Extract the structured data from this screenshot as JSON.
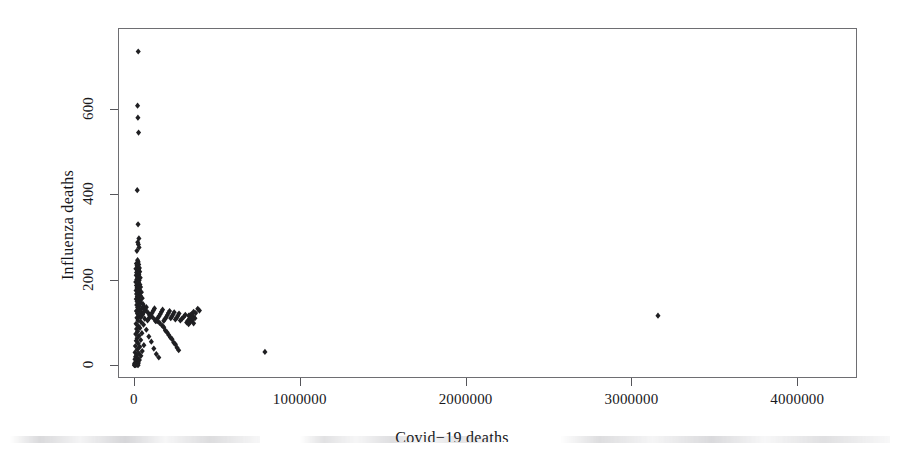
{
  "figure": {
    "type": "scatter-plot",
    "background_color": "#ffffff",
    "frame_color": "#6e6e72",
    "point_color": "#1f1f22"
  },
  "axes": {
    "x": {
      "label": "Covid−19 deaths",
      "ticks": [
        {
          "value": 0,
          "label": "0"
        },
        {
          "value": 1000000,
          "label": "1000000"
        },
        {
          "value": 2000000,
          "label": "2000000"
        },
        {
          "value": 3000000,
          "label": "3000000"
        },
        {
          "value": 4000000,
          "label": "4000000"
        }
      ],
      "range": [
        -96000,
        4360000
      ]
    },
    "y": {
      "label": "Influenza deaths",
      "ticks": [
        {
          "value": 0,
          "label": "0"
        },
        {
          "value": 200,
          "label": "200"
        },
        {
          "value": 400,
          "label": "400"
        },
        {
          "value": 600,
          "label": "600"
        }
      ],
      "range": [
        -30,
        790
      ]
    }
  },
  "artifact": {
    "name": "scan-smudge-band",
    "description": "faint grey band of clipped text from the page below"
  },
  "chart_data": {
    "type": "scatter",
    "title": "",
    "xlabel": "Covid−19 deaths",
    "ylabel": "Influenza deaths",
    "xlim": [
      -96000,
      4360000
    ],
    "ylim": [
      -30,
      790
    ],
    "xticks": [
      0,
      1000000,
      2000000,
      3000000,
      4000000
    ],
    "yticks": [
      0,
      200,
      400,
      600
    ],
    "grid": false,
    "legend": null,
    "marker": "filled-diamond",
    "marker_color": "#1f1f22",
    "points": [
      [
        26000,
        735
      ],
      [
        22000,
        608
      ],
      [
        24000,
        580
      ],
      [
        28000,
        545
      ],
      [
        20000,
        410
      ],
      [
        25000,
        330
      ],
      [
        30000,
        297
      ],
      [
        23000,
        288
      ],
      [
        27000,
        283
      ],
      [
        31000,
        276
      ],
      [
        18000,
        268
      ],
      [
        22000,
        246
      ],
      [
        26000,
        242
      ],
      [
        15000,
        238
      ],
      [
        29000,
        236
      ],
      [
        19000,
        233
      ],
      [
        24000,
        230
      ],
      [
        33000,
        228
      ],
      [
        12000,
        226
      ],
      [
        28000,
        224
      ],
      [
        21000,
        221
      ],
      [
        35000,
        219
      ],
      [
        16000,
        217
      ],
      [
        25000,
        215
      ],
      [
        30000,
        213
      ],
      [
        14000,
        211
      ],
      [
        27000,
        209
      ],
      [
        20000,
        207
      ],
      [
        38000,
        205
      ],
      [
        23000,
        203
      ],
      [
        17000,
        201
      ],
      [
        32000,
        199
      ],
      [
        26000,
        197
      ],
      [
        11000,
        195
      ],
      [
        29000,
        193
      ],
      [
        21000,
        191
      ],
      [
        36000,
        189
      ],
      [
        15000,
        187
      ],
      [
        24000,
        185
      ],
      [
        40000,
        183
      ],
      [
        18000,
        181
      ],
      [
        28000,
        179
      ],
      [
        33000,
        177
      ],
      [
        13000,
        175
      ],
      [
        22000,
        173
      ],
      [
        45000,
        171
      ],
      [
        26000,
        169
      ],
      [
        16000,
        167
      ],
      [
        31000,
        165
      ],
      [
        38000,
        163
      ],
      [
        20000,
        161
      ],
      [
        24000,
        159
      ],
      [
        50000,
        157
      ],
      [
        14000,
        155
      ],
      [
        29000,
        153
      ],
      [
        35000,
        151
      ],
      [
        19000,
        149
      ],
      [
        42000,
        147
      ],
      [
        25000,
        145
      ],
      [
        55000,
        143
      ],
      [
        17000,
        141
      ],
      [
        32000,
        139
      ],
      [
        60000,
        137
      ],
      [
        22000,
        135
      ],
      [
        47000,
        133
      ],
      [
        27000,
        131
      ],
      [
        70000,
        129
      ],
      [
        15000,
        127
      ],
      [
        38000,
        125
      ],
      [
        85000,
        123
      ],
      [
        21000,
        121
      ],
      [
        52000,
        119
      ],
      [
        95000,
        117
      ],
      [
        3160000,
        116
      ],
      [
        30000,
        115
      ],
      [
        110000,
        113
      ],
      [
        18000,
        111
      ],
      [
        65000,
        109
      ],
      [
        125000,
        107
      ],
      [
        25000,
        105
      ],
      [
        140000,
        103
      ],
      [
        43000,
        101
      ],
      [
        155000,
        99
      ],
      [
        13000,
        97
      ],
      [
        58000,
        95
      ],
      [
        170000,
        93
      ],
      [
        28000,
        91
      ],
      [
        180000,
        89
      ],
      [
        36000,
        87
      ],
      [
        16000,
        85
      ],
      [
        75000,
        83
      ],
      [
        190000,
        81
      ],
      [
        22000,
        79
      ],
      [
        200000,
        77
      ],
      [
        48000,
        75
      ],
      [
        11000,
        73
      ],
      [
        210000,
        71
      ],
      [
        31000,
        69
      ],
      [
        90000,
        67
      ],
      [
        220000,
        65
      ],
      [
        19000,
        63
      ],
      [
        230000,
        61
      ],
      [
        41000,
        59
      ],
      [
        14000,
        57
      ],
      [
        105000,
        55
      ],
      [
        240000,
        53
      ],
      [
        26000,
        51
      ],
      [
        250000,
        49
      ],
      [
        60000,
        47
      ],
      [
        9000,
        45
      ],
      [
        35000,
        43
      ],
      [
        260000,
        41
      ],
      [
        120000,
        39
      ],
      [
        21000,
        37
      ],
      [
        270000,
        35
      ],
      [
        790000,
        31
      ],
      [
        50000,
        33
      ],
      [
        7000,
        30
      ],
      [
        30000,
        28
      ],
      [
        135000,
        26
      ],
      [
        17000,
        24
      ],
      [
        42000,
        22
      ],
      [
        10000,
        20
      ],
      [
        150000,
        18
      ],
      [
        24000,
        16
      ],
      [
        6000,
        14
      ],
      [
        33000,
        12
      ],
      [
        13000,
        10
      ],
      [
        19000,
        8
      ],
      [
        8000,
        6
      ],
      [
        27000,
        5
      ],
      [
        4000,
        4
      ],
      [
        15000,
        3
      ],
      [
        10000,
        2
      ],
      [
        22000,
        2
      ],
      [
        5000,
        1
      ],
      [
        12000,
        1
      ],
      [
        18000,
        1
      ],
      [
        3000,
        0
      ],
      [
        8000,
        0
      ],
      [
        25000,
        0
      ],
      [
        385000,
        132
      ],
      [
        395000,
        128
      ],
      [
        360000,
        125
      ],
      [
        372000,
        122
      ],
      [
        350000,
        120
      ],
      [
        340000,
        118
      ],
      [
        330000,
        116
      ],
      [
        358000,
        114
      ],
      [
        345000,
        112
      ],
      [
        368000,
        110
      ],
      [
        335000,
        108
      ],
      [
        352000,
        106
      ],
      [
        325000,
        104
      ],
      [
        342000,
        102
      ],
      [
        318000,
        100
      ],
      [
        360000,
        98
      ],
      [
        330000,
        96
      ],
      [
        310000,
        118
      ],
      [
        300000,
        113
      ],
      [
        290000,
        109
      ],
      [
        280000,
        105
      ],
      [
        272000,
        121
      ],
      [
        265000,
        116
      ],
      [
        258000,
        111
      ],
      [
        250000,
        107
      ],
      [
        243000,
        124
      ],
      [
        236000,
        119
      ],
      [
        229000,
        114
      ],
      [
        222000,
        110
      ],
      [
        215000,
        127
      ],
      [
        208000,
        122
      ],
      [
        201000,
        117
      ],
      [
        194000,
        112
      ],
      [
        187000,
        108
      ],
      [
        180000,
        104
      ],
      [
        173000,
        130
      ],
      [
        166000,
        125
      ],
      [
        159000,
        120
      ],
      [
        152000,
        115
      ],
      [
        145000,
        111
      ],
      [
        138000,
        107
      ],
      [
        131000,
        103
      ],
      [
        124000,
        133
      ],
      [
        117000,
        128
      ],
      [
        110000,
        123
      ],
      [
        103000,
        118
      ],
      [
        96000,
        113
      ],
      [
        89000,
        109
      ],
      [
        82000,
        105
      ],
      [
        75000,
        136
      ],
      [
        68000,
        131
      ],
      [
        61000,
        126
      ],
      [
        54000,
        121
      ],
      [
        47000,
        116
      ],
      [
        40000,
        112
      ]
    ]
  }
}
